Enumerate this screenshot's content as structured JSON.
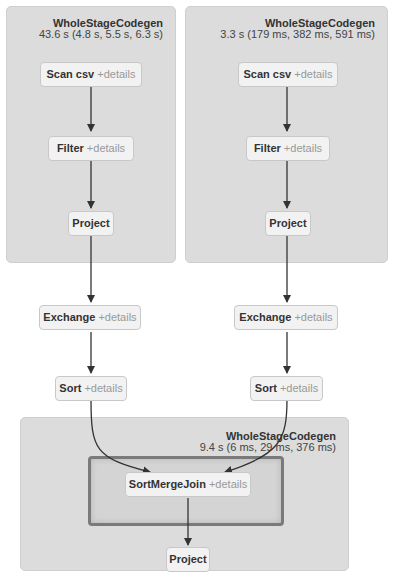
{
  "clusters": [
    {
      "title": "WholeStageCodegen",
      "metrics": "43.6 s (4.8 s, 5.5 s, 6.3 s)"
    },
    {
      "title": "WholeStageCodegen",
      "metrics": "3.3 s (179 ms, 382 ms, 591 ms)"
    },
    {
      "title": "WholeStageCodegen",
      "metrics": "9.4 s (6 ms, 29 ms, 376 ms)"
    }
  ],
  "nodes": {
    "left_scan": {
      "name": "Scan csv",
      "details": "+details"
    },
    "left_filter": {
      "name": "Filter",
      "details": "+details"
    },
    "left_project": {
      "name": "Project"
    },
    "left_exchange": {
      "name": "Exchange",
      "details": "+details"
    },
    "left_sort": {
      "name": "Sort",
      "details": "+details"
    },
    "right_scan": {
      "name": "Scan csv",
      "details": "+details"
    },
    "right_filter": {
      "name": "Filter",
      "details": "+details"
    },
    "right_project": {
      "name": "Project"
    },
    "right_exchange": {
      "name": "Exchange",
      "details": "+details"
    },
    "right_sort": {
      "name": "Sort",
      "details": "+details"
    },
    "join": {
      "name": "SortMergeJoin",
      "details": "+details"
    },
    "final_project": {
      "name": "Project"
    }
  },
  "colors": {
    "cluster_bg": "#dcdcdc",
    "node_bg": "#f2f2f2",
    "edge": "#333333",
    "details_text": "#999999",
    "highlight_border": "#7a7a7a"
  }
}
